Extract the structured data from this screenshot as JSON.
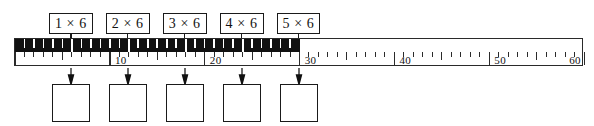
{
  "worksheet": {
    "type": "number-line-skip-counting",
    "title": "Multiples of 6 on a number line"
  },
  "ruler": {
    "min": 0,
    "max": 60,
    "unit_step": 1,
    "major_step": 10,
    "shaded_from": 0,
    "shaded_to": 30,
    "numbers": [
      {
        "value": 10,
        "text": "10"
      },
      {
        "value": 20,
        "text": "20"
      },
      {
        "value": 30,
        "text": "30"
      },
      {
        "value": 40,
        "text": "40"
      },
      {
        "value": 50,
        "text": "50"
      },
      {
        "value": 60,
        "text": "60"
      }
    ],
    "group_marks": [
      6,
      12,
      18,
      24,
      30
    ]
  },
  "problems": [
    {
      "label": "1 × 6",
      "factor": 1,
      "multiplier": 6,
      "mark": 6,
      "answer": ""
    },
    {
      "label": "2 × 6",
      "factor": 2,
      "multiplier": 6,
      "mark": 12,
      "answer": ""
    },
    {
      "label": "3 × 6",
      "factor": 3,
      "multiplier": 6,
      "mark": 18,
      "answer": ""
    },
    {
      "label": "4 × 6",
      "factor": 4,
      "multiplier": 6,
      "mark": 24,
      "answer": ""
    },
    {
      "label": "5 × 6",
      "factor": 5,
      "multiplier": 6,
      "mark": 30,
      "answer": ""
    }
  ],
  "colors": {
    "ink": "#111111",
    "shaded_bar": "#111111",
    "paper": "#ffffff",
    "tick": "#2b2b2b"
  }
}
